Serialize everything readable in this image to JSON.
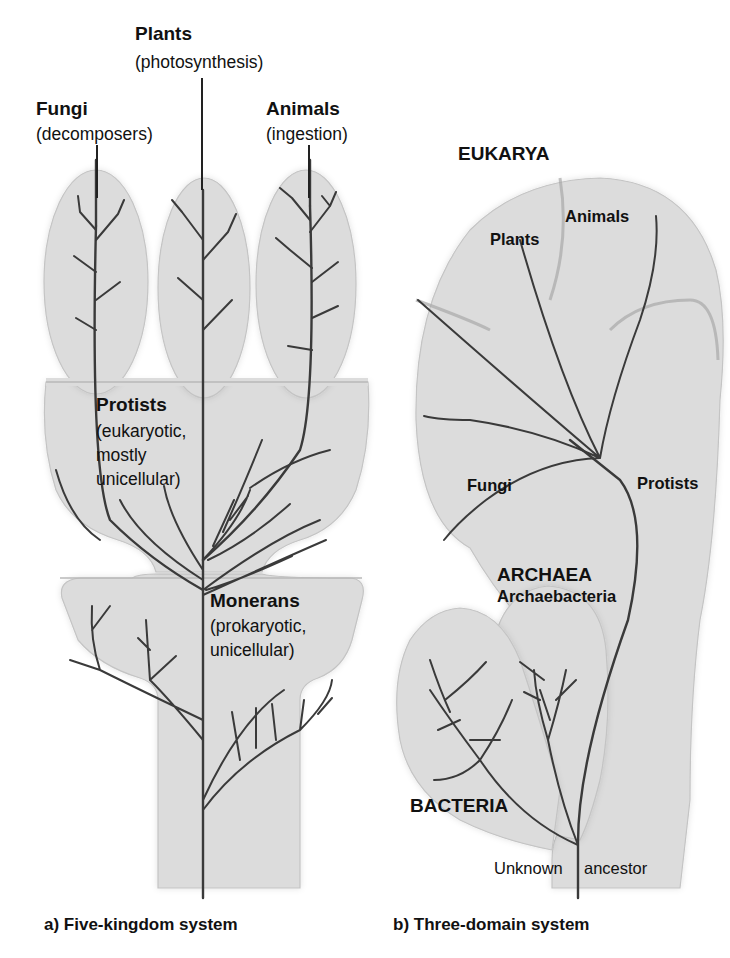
{
  "figure": {
    "panel_a": {
      "caption": "a) Five-kingdom system",
      "kingdoms": {
        "plants": {
          "name": "Plants",
          "note": "(photosynthesis)"
        },
        "fungi": {
          "name": "Fungi",
          "note": "(decomposers)"
        },
        "animals": {
          "name": "Animals",
          "note": "(ingestion)"
        },
        "protists": {
          "name": "Protists",
          "note_line1": "(eukaryotic,",
          "note_line2": "mostly",
          "note_line3": "unicellular)"
        },
        "monerans": {
          "name": "Monerans",
          "note_line1": "(prokaryotic,",
          "note_line2": "unicellular)"
        }
      }
    },
    "panel_b": {
      "caption": "b) Three-domain system",
      "domains": {
        "eukarya": "EUKARYA",
        "archaea": "ARCHAEA",
        "archaea_sub": "Archaebacteria",
        "bacteria": "BACTERIA"
      },
      "groups": {
        "animals": "Animals",
        "plants": "Plants",
        "fungi": "Fungi",
        "protists": "Protists"
      },
      "root": {
        "left": "Unknown",
        "right": "ancestor"
      }
    },
    "colors": {
      "fill": "#dcdcdc",
      "branch": "#3a3a3a",
      "text": "#111111"
    }
  }
}
